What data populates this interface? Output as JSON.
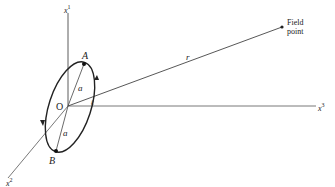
{
  "figure": {
    "axes": {
      "x1": {
        "label": "x",
        "superscript": "1"
      },
      "x2": {
        "label": "x",
        "superscript": "2"
      },
      "x3": {
        "label": "x",
        "superscript": "3"
      }
    },
    "origin_label": "O",
    "points": {
      "A": "A",
      "B": "B"
    },
    "radius_labels": [
      "a",
      "a"
    ],
    "distance_label": "r",
    "field_point": {
      "line1": "Field",
      "line2": "point"
    },
    "small_label_near_x3": "ℓ",
    "colors": {
      "ink": "#222222",
      "background": "#ffffff"
    }
  }
}
